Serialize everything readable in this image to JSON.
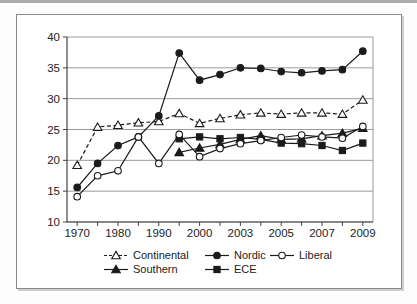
{
  "figure": {
    "background": "#ffffff",
    "border_color": "#8a8a8a"
  },
  "chart_data": {
    "type": "line",
    "title": "",
    "xlabel": "",
    "ylabel": "",
    "grid": "horizontal",
    "line_color": "#1b1b1b",
    "grid_color": "#9a9a9a",
    "axis_color": "#444444",
    "text_color": "#222222",
    "y_axis": {
      "min": 10,
      "max": 40,
      "tick_step": 5,
      "tick_labels": [
        "10",
        "15",
        "20",
        "25",
        "30",
        "35",
        "40"
      ]
    },
    "x_categories": [
      "1970",
      "1975",
      "1980",
      "1985",
      "1990",
      "1995",
      "2000",
      "2002",
      "2003",
      "2004",
      "2005",
      "2006",
      "2007",
      "2008",
      "2009"
    ],
    "x_tick_labels_visible": [
      "1970",
      "1980",
      "1990",
      "2000",
      "2003",
      "2005",
      "2007",
      "2009"
    ],
    "series": [
      {
        "name": "Continental",
        "marker": "triangle-open",
        "line_style": "dashed",
        "values": [
          19.2,
          25.4,
          25.7,
          26.1,
          26.3,
          27.6,
          26.0,
          26.8,
          27.4,
          27.7,
          27.5,
          27.7,
          27.7,
          27.5,
          29.8
        ]
      },
      {
        "name": "Nordic",
        "marker": "circle-filled",
        "line_style": "solid",
        "values": [
          15.6,
          19.5,
          22.4,
          23.8,
          27.2,
          37.4,
          33.0,
          33.9,
          35.0,
          34.9,
          34.4,
          34.2,
          34.5,
          34.7,
          37.7
        ]
      },
      {
        "name": "Liberal",
        "marker": "circle-open",
        "line_style": "solid",
        "values": [
          14.1,
          17.5,
          18.3,
          23.8,
          19.5,
          24.2,
          20.6,
          21.9,
          22.7,
          23.2,
          23.7,
          24.1,
          23.8,
          23.6,
          25.5
        ]
      },
      {
        "name": "Southern",
        "marker": "triangle-filled",
        "line_style": "solid",
        "values": [
          null,
          null,
          null,
          null,
          null,
          21.3,
          22.0,
          22.6,
          23.4,
          24.0,
          23.4,
          23.5,
          24.0,
          24.4,
          25.2
        ]
      },
      {
        "name": "ECE",
        "marker": "square-filled",
        "line_style": "solid",
        "values": [
          null,
          null,
          null,
          null,
          null,
          23.5,
          23.8,
          23.5,
          23.7,
          23.4,
          22.8,
          22.7,
          22.4,
          21.6,
          22.8
        ]
      }
    ],
    "legend": {
      "position": "bottom",
      "rows": [
        [
          "Continental",
          "Nordic",
          "Liberal"
        ],
        [
          "Southern",
          "ECE"
        ]
      ]
    }
  }
}
